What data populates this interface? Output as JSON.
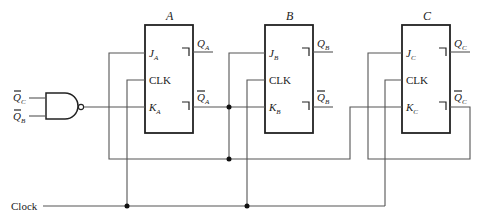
{
  "diagram": {
    "type": "circuit",
    "flip_flops": [
      {
        "name": "A",
        "j": "J",
        "j_sub": "A",
        "clk": "CLK",
        "k": "K",
        "k_sub": "A",
        "q": "Q",
        "q_sub": "A",
        "qbar": "Q",
        "qbar_sub": "A"
      },
      {
        "name": "B",
        "j": "J",
        "j_sub": "B",
        "clk": "CLK",
        "k": "K",
        "k_sub": "B",
        "q": "Q",
        "q_sub": "B",
        "qbar": "Q",
        "qbar_sub": "B"
      },
      {
        "name": "C",
        "j": "J",
        "j_sub": "C",
        "clk": "CLK",
        "k": "K",
        "k_sub": "C",
        "q": "Q",
        "q_sub": "C",
        "qbar": "Q",
        "qbar_sub": "C"
      }
    ],
    "nand_inputs": [
      {
        "label": "Q",
        "sub": "C",
        "inverted": true
      },
      {
        "label": "Q",
        "sub": "B",
        "inverted": true
      }
    ],
    "clock_label": "Clock"
  }
}
